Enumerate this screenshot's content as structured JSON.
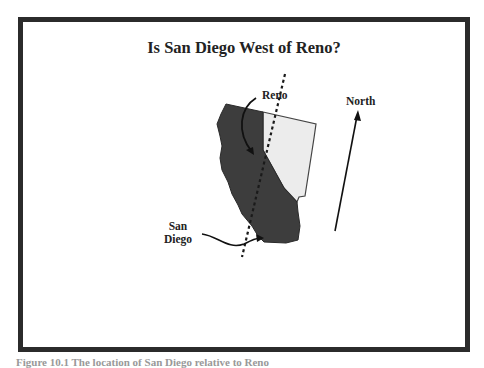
{
  "title": "Is San Diego West of Reno?",
  "labels": {
    "reno": "Reno",
    "north": "North",
    "san_diego_line1": "San",
    "san_diego_line2": "Diego"
  },
  "caption": "Figure 10.1  The location of San Diego relative to Reno",
  "colors": {
    "frame": "#2b2b2b",
    "california": "#3d3d3d",
    "nevada": "#ececec",
    "text": "#222222"
  }
}
